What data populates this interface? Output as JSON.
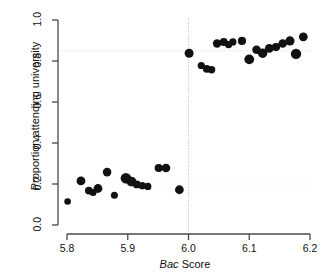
{
  "chart_data": {
    "type": "scatter",
    "title": "",
    "xlabel": "Bac Score",
    "xlabel_italic_part": "Bac",
    "xlabel_roman_part": " Score",
    "ylabel": "Proportion attending university",
    "xlim": [
      5.8,
      6.2
    ],
    "ylim": [
      0.0,
      1.0
    ],
    "xticks": [
      5.8,
      5.9,
      6.0,
      6.1,
      6.2
    ],
    "xtick_labels": [
      "5.8",
      "5.9",
      "6.0",
      "6.1",
      "6.2"
    ],
    "yticks": [
      0.0,
      0.2,
      0.4,
      0.6,
      0.8,
      1.0
    ],
    "ytick_labels": [
      "0.0",
      "0.2",
      "0.4",
      "0.6",
      "0.8",
      "1.0"
    ],
    "grid": false,
    "legend": "none",
    "marker_color": "#111111",
    "annotations": [
      {
        "name": "cutoff-line",
        "type": "vline",
        "x": 6.0,
        "style": "dotted",
        "color": "#b9b9b9"
      },
      {
        "name": "upper-reference-line",
        "type": "hline",
        "y": 0.85,
        "style": "dotted",
        "color": "#dcdcdc"
      },
      {
        "name": "lower-reference-line",
        "type": "hline",
        "y": 0.2,
        "style": "dotted",
        "color": "#ececec"
      }
    ],
    "points": [
      {
        "x": 5.801,
        "y": 0.115,
        "size": 3.3
      },
      {
        "x": 5.823,
        "y": 0.215,
        "size": 4.4
      },
      {
        "x": 5.836,
        "y": 0.168,
        "size": 3.9
      },
      {
        "x": 5.843,
        "y": 0.158,
        "size": 3.5
      },
      {
        "x": 5.851,
        "y": 0.178,
        "size": 4.4
      },
      {
        "x": 5.866,
        "y": 0.258,
        "size": 4.3
      },
      {
        "x": 5.878,
        "y": 0.145,
        "size": 3.5
      },
      {
        "x": 5.897,
        "y": 0.228,
        "size": 5.3
      },
      {
        "x": 5.906,
        "y": 0.212,
        "size": 4.9
      },
      {
        "x": 5.915,
        "y": 0.198,
        "size": 3.9
      },
      {
        "x": 5.924,
        "y": 0.192,
        "size": 3.6
      },
      {
        "x": 5.933,
        "y": 0.188,
        "size": 3.6
      },
      {
        "x": 5.951,
        "y": 0.278,
        "size": 4.1
      },
      {
        "x": 5.963,
        "y": 0.278,
        "size": 4.3
      },
      {
        "x": 5.985,
        "y": 0.172,
        "size": 4.4
      },
      {
        "x": 6.001,
        "y": 0.838,
        "size": 4.5
      },
      {
        "x": 6.021,
        "y": 0.778,
        "size": 3.6
      },
      {
        "x": 6.03,
        "y": 0.762,
        "size": 3.9
      },
      {
        "x": 6.038,
        "y": 0.757,
        "size": 3.7
      },
      {
        "x": 6.047,
        "y": 0.885,
        "size": 4.2
      },
      {
        "x": 6.058,
        "y": 0.893,
        "size": 4.0
      },
      {
        "x": 6.066,
        "y": 0.88,
        "size": 3.7
      },
      {
        "x": 6.073,
        "y": 0.893,
        "size": 3.6
      },
      {
        "x": 6.088,
        "y": 0.898,
        "size": 4.1
      },
      {
        "x": 6.1,
        "y": 0.808,
        "size": 4.9
      },
      {
        "x": 6.112,
        "y": 0.855,
        "size": 4.3
      },
      {
        "x": 6.122,
        "y": 0.838,
        "size": 4.7
      },
      {
        "x": 6.133,
        "y": 0.862,
        "size": 4.4
      },
      {
        "x": 6.144,
        "y": 0.868,
        "size": 4.1
      },
      {
        "x": 6.155,
        "y": 0.885,
        "size": 4.3
      },
      {
        "x": 6.167,
        "y": 0.898,
        "size": 4.6
      },
      {
        "x": 6.177,
        "y": 0.835,
        "size": 5.2
      },
      {
        "x": 6.189,
        "y": 0.918,
        "size": 4.4
      }
    ]
  },
  "axes": {
    "x_title_italic": "Bac",
    "x_title_rest": " Score",
    "y_title": "Proportion attending university"
  }
}
